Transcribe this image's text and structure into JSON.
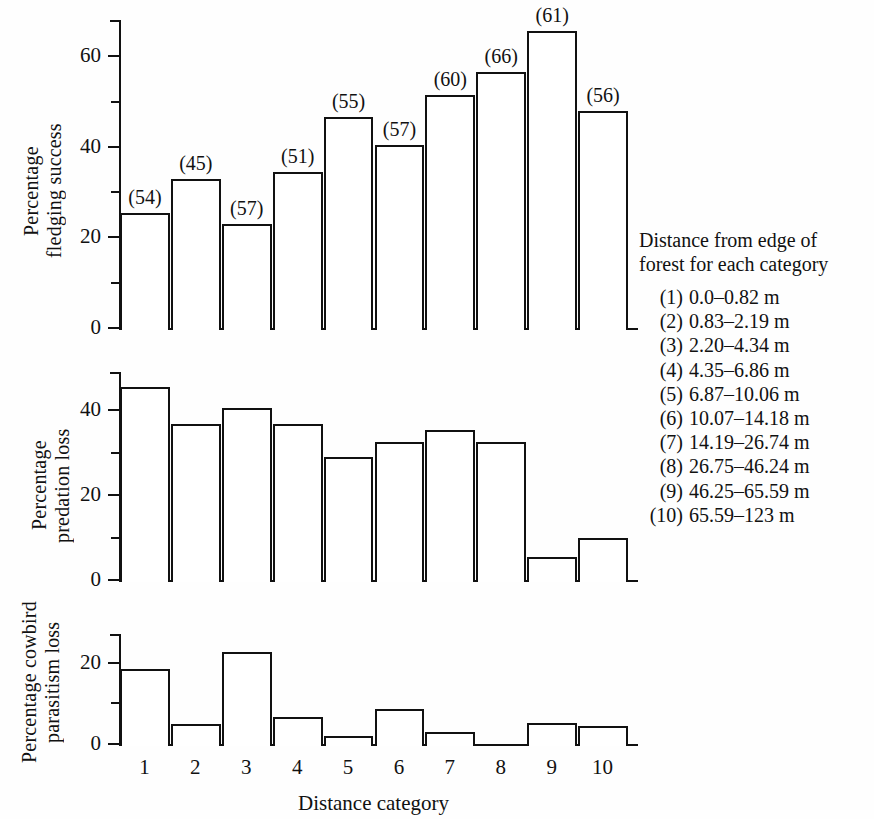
{
  "chart_data": [
    {
      "type": "bar",
      "panel": 1,
      "title": "",
      "xlabel": "",
      "ylabel": "Percentage\nfledging success",
      "categories": [
        "1",
        "2",
        "3",
        "4",
        "5",
        "6",
        "7",
        "8",
        "9",
        "10"
      ],
      "values": [
        25.5,
        33.0,
        23.0,
        34.5,
        46.5,
        40.5,
        51.5,
        56.5,
        65.5,
        48.0
      ],
      "point_labels": [
        "(54)",
        "(45)",
        "(57)",
        "(51)",
        "(55)",
        "(57)",
        "(60)",
        "(66)",
        "(61)",
        "(56)"
      ],
      "ylim": [
        0,
        68
      ],
      "yticks": [
        0,
        20,
        40,
        60
      ],
      "yticklabels": [
        "0",
        "20",
        "40",
        "60"
      ],
      "yminorticks": [
        10,
        30,
        50
      ],
      "grid": false,
      "legend": "none"
    },
    {
      "type": "bar",
      "panel": 2,
      "title": "",
      "xlabel": "",
      "ylabel": "Percentage\npredation loss",
      "categories": [
        "1",
        "2",
        "3",
        "4",
        "5",
        "6",
        "7",
        "8",
        "9",
        "10"
      ],
      "values": [
        45.5,
        36.8,
        40.5,
        36.7,
        29.0,
        32.5,
        35.3,
        32.5,
        5.4,
        10.0
      ],
      "point_labels": [
        "",
        "",
        "",
        "",
        "",
        "",
        "",
        "",
        "",
        ""
      ],
      "ylim": [
        0,
        49
      ],
      "yticks": [
        0,
        20,
        40
      ],
      "yticklabels": [
        "0",
        "20",
        "40"
      ],
      "yminorticks": [
        10,
        30
      ],
      "grid": false,
      "legend": "none"
    },
    {
      "type": "bar",
      "panel": 3,
      "title": "",
      "xlabel": "Distance category",
      "ylabel": "Percentage cowbird\nparasitism loss",
      "categories": [
        "1",
        "2",
        "3",
        "4",
        "5",
        "6",
        "7",
        "8",
        "9",
        "10"
      ],
      "values": [
        18.5,
        5.0,
        22.5,
        6.7,
        2.0,
        8.5,
        3.0,
        0.0,
        5.2,
        4.5
      ],
      "point_labels": [
        "",
        "",
        "",
        "",
        "",
        "",
        "",
        "",
        "",
        ""
      ],
      "ylim": [
        0,
        27
      ],
      "yticks": [
        0,
        20
      ],
      "yticklabels": [
        "0",
        "20"
      ],
      "yminorticks": [
        10
      ],
      "grid": false,
      "legend": "none"
    }
  ],
  "legend": {
    "title": "Distance from edge of\nforest for each category",
    "items": [
      {
        "num": "(1)",
        "range": "0.0–0.82 m"
      },
      {
        "num": "(2)",
        "range": "0.83–2.19 m"
      },
      {
        "num": "(3)",
        "range": "2.20–4.34 m"
      },
      {
        "num": "(4)",
        "range": "4.35–6.86 m"
      },
      {
        "num": "(5)",
        "range": "6.87–10.06 m"
      },
      {
        "num": "(6)",
        "range": "10.07–14.18 m"
      },
      {
        "num": "(7)",
        "range": "14.19–26.74 m"
      },
      {
        "num": "(8)",
        "range": "26.75–46.24 m"
      },
      {
        "num": "(9)",
        "range": "46.25–65.59 m"
      },
      {
        "num": "(10)",
        "range": "65.59–123 m"
      }
    ]
  },
  "axis": {
    "x_title": "Distance category",
    "x_tick_labels": [
      "1",
      "2",
      "3",
      "4",
      "5",
      "6",
      "7",
      "8",
      "9",
      "10"
    ]
  },
  "colors": {
    "ink": "#111111",
    "paper": "#fefefe",
    "bar_fill": "#ffffff"
  }
}
